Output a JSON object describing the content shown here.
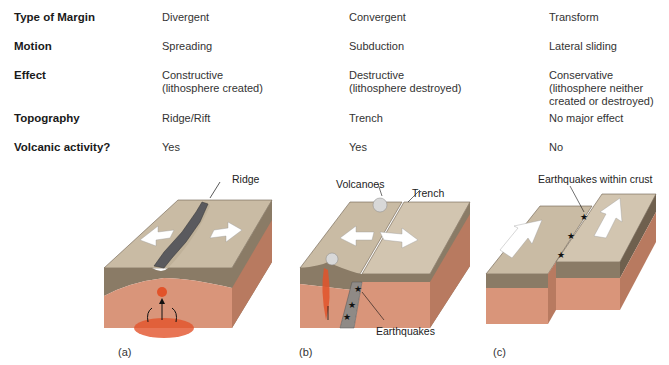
{
  "table": {
    "rows": [
      {
        "label": "Type of Margin",
        "values": [
          "Divergent",
          "Convergent",
          "Transform"
        ]
      },
      {
        "label": "Motion",
        "values": [
          "Spreading",
          "Subduction",
          "Lateral sliding"
        ]
      },
      {
        "label": "Effect",
        "values": [
          "Constructive\n(lithosphere created)",
          "Destructive\n(lithosphere destroyed)",
          "Conservative\n(lithosphere neither\ncreated or destroyed)"
        ]
      },
      {
        "label": "Topography",
        "values": [
          "Ridge/Rift",
          "Trench",
          "No major effect"
        ]
      },
      {
        "label": "Volcanic activity?",
        "values": [
          "Yes",
          "Yes",
          "No"
        ]
      }
    ]
  },
  "diagrams": {
    "a": {
      "caption": "(a)",
      "labels": {
        "ridge": "Ridge"
      }
    },
    "b": {
      "caption": "(b)",
      "labels": {
        "volcanoes": "Volcanoes",
        "trench": "Trench",
        "earthquakes": "Earthquakes"
      }
    },
    "c": {
      "caption": "(c)",
      "labels": {
        "earthquakes": "Earthquakes within crust"
      }
    }
  },
  "colors": {
    "crust_top": "#c9bba4",
    "crust_side": "#8a7b66",
    "mantle": "#d9957a",
    "mantle_side": "#b87a60",
    "magma": "#e2532a",
    "ridge_rock": "#5a5a5e"
  }
}
